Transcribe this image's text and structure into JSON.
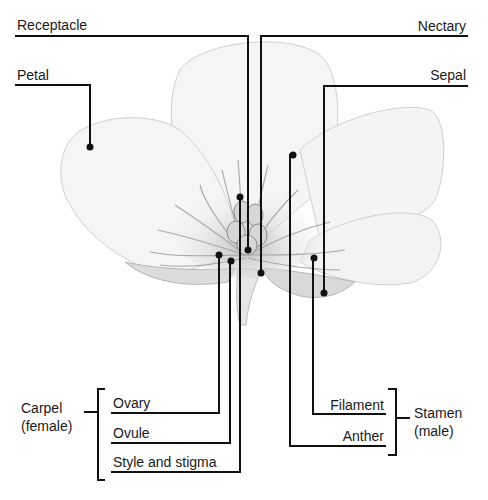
{
  "diagram": {
    "labels": {
      "receptacle": "Receptacle",
      "petal": "Petal",
      "nectary": "Nectary",
      "sepal": "Sepal",
      "ovary": "Ovary",
      "ovule": "Ovule",
      "style_and_stigma": "Style and stigma",
      "filament": "Filament",
      "anther": "Anther"
    },
    "groups": {
      "carpel": {
        "name": "Carpel",
        "sub": "(female)",
        "members": [
          "Ovary",
          "Ovule",
          "Style and stigma"
        ]
      },
      "stamen": {
        "name": "Stamen",
        "sub": "(male)",
        "members": [
          "Filament",
          "Anther"
        ]
      }
    },
    "colors": {
      "line": "#111111",
      "petal_fill": "#f4f4f4",
      "petal_stroke": "#c8c8c8",
      "shading": "#9a9a9a",
      "background": "#ffffff"
    }
  }
}
